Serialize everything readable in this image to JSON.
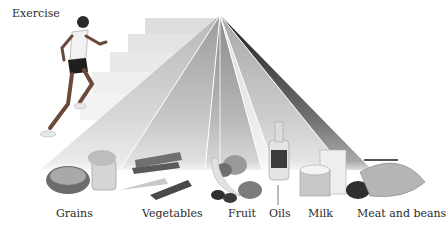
{
  "diagram": {
    "title_label": "Exercise",
    "food_groups": [
      {
        "name": "Grains",
        "x": 56
      },
      {
        "name": "Vegetables",
        "x": 142
      },
      {
        "name": "Fruit",
        "x": 228
      },
      {
        "name": "Oils",
        "x": 269
      },
      {
        "name": "Milk",
        "x": 308
      },
      {
        "name": "Meat and beans",
        "x": 357
      }
    ],
    "colors": {
      "background": "#ffffff",
      "band_light": "#d8d8d8",
      "band_mid": "#9a9a9a",
      "band_dark": "#2b2b2b",
      "stairs": "#e6e6e6"
    }
  }
}
